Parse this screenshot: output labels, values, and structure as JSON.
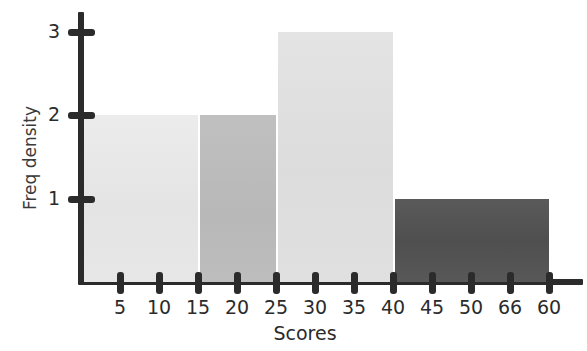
{
  "chart_data": {
    "type": "bar",
    "title": "",
    "xlabel": "Scores",
    "ylabel": "Freq density",
    "grid": false,
    "legend": null,
    "xlim": [
      0,
      65
    ],
    "ylim": [
      0,
      3.3
    ],
    "x_tick_labels": [
      "5",
      "10",
      "15",
      "20",
      "25",
      "30",
      "35",
      "40",
      "45",
      "50",
      "66",
      "60"
    ],
    "x_tick_values": [
      5,
      10,
      15,
      20,
      25,
      30,
      35,
      40,
      45,
      50,
      55,
      60
    ],
    "y_tick_labels": [
      "1",
      "2",
      "3"
    ],
    "y_tick_values": [
      1,
      2,
      3
    ],
    "bins": [
      {
        "label": "0-15",
        "start": 0,
        "end": 15,
        "value": 2,
        "color": "#e8e8e8"
      },
      {
        "label": "15-25",
        "start": 15,
        "end": 25,
        "value": 2,
        "color": "#bcbcbc"
      },
      {
        "label": "25-40",
        "start": 25,
        "end": 40,
        "value": 3,
        "color": "#e0e0e0"
      },
      {
        "label": "40-60",
        "start": 40,
        "end": 60,
        "value": 1,
        "color": "#555555"
      }
    ],
    "categories": [
      "0-15",
      "15-25",
      "25-40",
      "40-60"
    ],
    "values": [
      2,
      2,
      3,
      1
    ],
    "axis_color": "#2b2b2b",
    "background_color": "#ffffff"
  }
}
